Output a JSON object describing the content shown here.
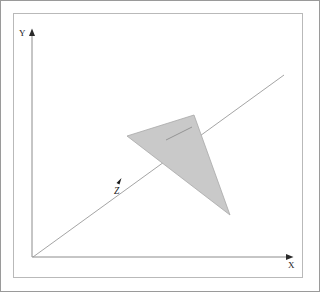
{
  "figure": {
    "background_color": "#ffffff",
    "outer_border_color": "#9a9a9a",
    "inner_frame_color": "#b9b9b9"
  },
  "axes": {
    "x_axis": {
      "label": "X",
      "label_position": {
        "x": 290,
        "y": 267
      },
      "start": {
        "x": 32,
        "y": 257
      },
      "end": {
        "x": 293,
        "y": 257
      },
      "color": "#8c8c8c",
      "has_arrowhead": true
    },
    "y_axis": {
      "label": "Y",
      "label_position": {
        "x": 20,
        "y": 35
      },
      "start": {
        "x": 32,
        "y": 257
      },
      "end": {
        "x": 32,
        "y": 29
      },
      "color": "#8c8c8c",
      "has_arrowhead": true
    },
    "origin": {
      "x": 32,
      "y": 257
    }
  },
  "line": {
    "name": "diagonal-line",
    "start": {
      "x": 33,
      "y": 257
    },
    "end": {
      "x": 284,
      "y": 75
    },
    "color": "#9a9a9a",
    "width": 0.9
  },
  "triangle": {
    "name": "shaded-triangle",
    "vertices": [
      {
        "x": 127,
        "y": 136
      },
      {
        "x": 194,
        "y": 115
      },
      {
        "x": 230,
        "y": 215
      }
    ],
    "fill_color": "#c9c9c9",
    "stroke_color": "#a8a8a8"
  },
  "inner_segment": {
    "name": "interior-segment",
    "start": {
      "x": 166,
      "y": 140
    },
    "end": {
      "x": 192,
      "y": 127
    },
    "color": "#9a9a9a"
  },
  "z_marker": {
    "label": "Z",
    "label_position": {
      "x": 114,
      "y": 193
    },
    "arrow_tip": {
      "x": 121,
      "y": 179
    },
    "color": "#1a1a1a"
  },
  "colors": {
    "ink": "#1a1a1a",
    "line_gray": "#9a9a9a",
    "fill_gray": "#c9c9c9",
    "frame_gray": "#b9b9b9",
    "border_gray": "#9a9a9a"
  }
}
